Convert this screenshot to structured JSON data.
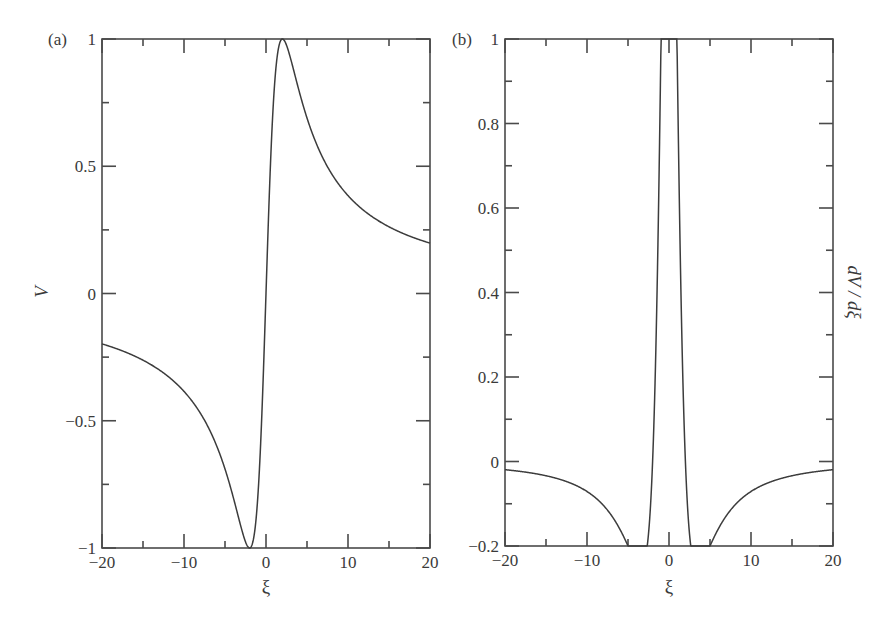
{
  "chart_data": [
    {
      "type": "line",
      "panel_tag": "(a)",
      "title": "",
      "xlabel": "ξ",
      "ylabel": "V",
      "xlim": [
        -20,
        20
      ],
      "ylim": [
        -1,
        1
      ],
      "x_ticks": [
        "−20",
        "−10",
        "0",
        "10",
        "20"
      ],
      "y_ticks": [
        "−1",
        "−0.5",
        "0",
        "0.5",
        "1"
      ],
      "grid": false,
      "legend": null,
      "series": [
        {
          "name": "V",
          "x": [
            -20,
            -15,
            -10,
            -6,
            -4,
            -3,
            -2,
            -1,
            0,
            1,
            2,
            3,
            4,
            6,
            10,
            15,
            20
          ],
          "values": [
            -0.198,
            -0.262,
            -0.385,
            -0.6,
            -0.8,
            -0.923,
            -1.0,
            -0.8,
            0.0,
            0.8,
            1.0,
            0.923,
            0.8,
            0.6,
            0.385,
            0.262,
            0.198
          ]
        }
      ]
    },
    {
      "type": "line",
      "panel_tag": "(b)",
      "title": "",
      "xlabel": "ξ",
      "ylabel": "dV / dξ",
      "xlim": [
        -20,
        20
      ],
      "ylim": [
        -0.2,
        1
      ],
      "x_ticks": [
        "−20",
        "−10",
        "0",
        "10",
        "20"
      ],
      "y_ticks": [
        "−0.2",
        "0",
        "0.2",
        "0.4",
        "0.6",
        "0.8",
        "1"
      ],
      "grid": false,
      "legend": null,
      "series": [
        {
          "name": "dV/dξ",
          "x": [
            -20,
            -15,
            -10,
            -6,
            -3.46,
            -2,
            -1,
            0,
            1,
            2,
            3.46,
            6,
            10,
            15,
            20
          ],
          "values": [
            -0.0097,
            -0.0168,
            -0.0355,
            -0.08,
            -0.125,
            0.0,
            0.48,
            1.0,
            0.48,
            0.0,
            -0.125,
            -0.08,
            -0.0355,
            -0.0168,
            -0.0097
          ]
        }
      ]
    }
  ]
}
